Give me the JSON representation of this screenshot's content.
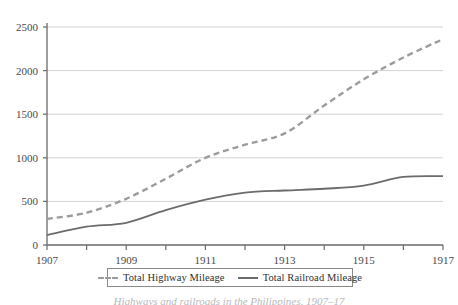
{
  "chart_data": {
    "type": "line",
    "title": "",
    "subtitle": "",
    "xlabel": "",
    "ylabel": "",
    "x": [
      1907,
      1908,
      1909,
      1910,
      1911,
      1912,
      1913,
      1914,
      1915,
      1916,
      1917
    ],
    "xtick_labels": [
      "1907",
      "1909",
      "1911",
      "1913",
      "1915",
      "1917"
    ],
    "xtick_values": [
      1907,
      1909,
      1911,
      1913,
      1915,
      1917
    ],
    "ytick_labels": [
      "0",
      "500",
      "1000",
      "1500",
      "2000",
      "2500"
    ],
    "ytick_values": [
      0,
      500,
      1000,
      1500,
      2000,
      2500
    ],
    "xlim": [
      1907,
      1917
    ],
    "ylim": [
      0,
      2500
    ],
    "grid": "horizontal",
    "legend_position": "bottom",
    "series": [
      {
        "name": "Total Highway Mileage",
        "style": "dashed",
        "color": "#9c9c9c",
        "values": [
          300,
          370,
          530,
          760,
          1000,
          1150,
          1280,
          1600,
          1900,
          2150,
          2360
        ]
      },
      {
        "name": "Total Railroad Mileage",
        "style": "solid",
        "color": "#6b6b6b",
        "values": [
          115,
          210,
          255,
          400,
          520,
          600,
          625,
          645,
          680,
          780,
          790
        ]
      }
    ]
  },
  "legend": {
    "items": [
      {
        "label": "Total Highway Mileage",
        "style": "dashed",
        "color": "#9c9c9c"
      },
      {
        "label": "Total Railroad Mileage",
        "style": "solid",
        "color": "#6b6b6b"
      }
    ]
  },
  "caption": {
    "text": "Highways and railroads in the Philippines, 1907–17"
  },
  "colors": {
    "axis": "#6a6a6a",
    "grid": "#d3d3d3",
    "highway": "#9c9c9c",
    "railroad": "#6b6b6b",
    "text": "#3b3b3b"
  }
}
